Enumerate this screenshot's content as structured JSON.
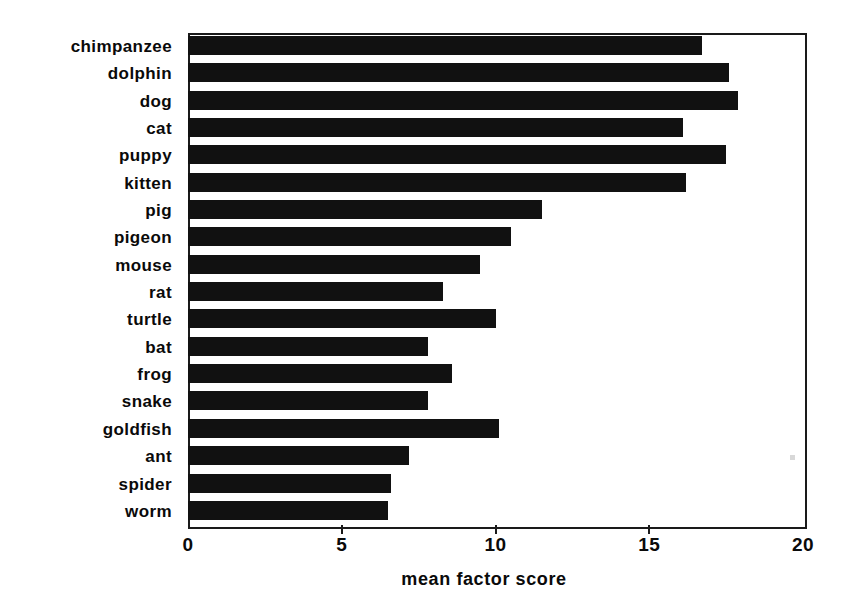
{
  "chart_data": {
    "type": "bar",
    "orientation": "horizontal",
    "title": "",
    "xlabel": "mean factor score",
    "ylabel": "",
    "xlim": [
      0,
      20
    ],
    "xticks": [
      0,
      5,
      10,
      15,
      20
    ],
    "xtick_labels": [
      "0",
      "5",
      "10",
      "15",
      "20"
    ],
    "grid": false,
    "legend": null,
    "bar_color": "#111111",
    "background_color": "#ffffff",
    "categories": [
      "chimpanzee",
      "dolphin",
      "dog",
      "cat",
      "puppy",
      "kitten",
      "pig",
      "pigeon",
      "mouse",
      "rat",
      "turtle",
      "bat",
      "frog",
      "snake",
      "goldfish",
      "ant",
      "spider",
      "worm"
    ],
    "values": [
      16.7,
      17.6,
      17.9,
      16.1,
      17.5,
      16.2,
      11.5,
      10.5,
      9.5,
      8.3,
      10.0,
      7.8,
      8.6,
      7.8,
      10.1,
      7.2,
      6.6,
      6.5
    ]
  }
}
